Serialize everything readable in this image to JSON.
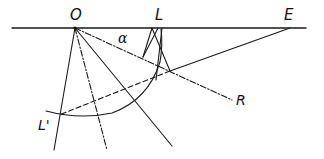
{
  "diagram": {
    "type": "geometric-construction",
    "stroke_color": "#1a1a1a",
    "background": "#ffffff",
    "labels": {
      "O": "O",
      "L": "L",
      "E": "E",
      "alpha": "α",
      "R": "R",
      "L_prime": "L'"
    },
    "points": {
      "O": [
        75,
        28
      ],
      "L": [
        159,
        28
      ],
      "E": [
        290,
        28
      ],
      "R": [
        232,
        100
      ],
      "L_prime": [
        59,
        115
      ]
    },
    "lines": [
      {
        "name": "baseline",
        "style": "solid",
        "from": [
          12,
          28
        ],
        "to": [
          306,
          28
        ]
      },
      {
        "name": "O-to-R",
        "style": "dash-dot",
        "from": [
          75,
          28
        ],
        "to": [
          232,
          100
        ]
      },
      {
        "name": "E-to-intersection",
        "style": "solid",
        "from": [
          290,
          28
        ],
        "to": [
          170,
          71
        ]
      },
      {
        "name": "intersection-to-L-prime",
        "style": "dashed",
        "from": [
          170,
          71
        ],
        "to": [
          59,
          115
        ]
      },
      {
        "name": "O-ray-left",
        "style": "solid",
        "from": [
          75,
          28
        ],
        "to": [
          54,
          150
        ]
      },
      {
        "name": "O-ray-dashdot",
        "style": "dash-dot",
        "from": [
          75,
          28
        ],
        "to": [
          107,
          150
        ]
      },
      {
        "name": "O-ray-right",
        "style": "solid",
        "from": [
          75,
          28
        ],
        "to": [
          172,
          146
        ]
      }
    ],
    "arc": {
      "name": "arc-through-L-prime",
      "style": "solid"
    }
  }
}
